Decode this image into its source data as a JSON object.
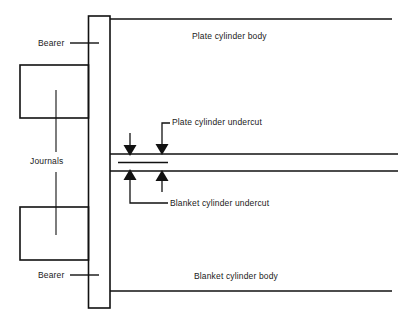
{
  "diagram": {
    "stroke_color": "#111111",
    "background_color": "#ffffff",
    "labels": {
      "bearer_top": "Bearer",
      "bearer_bottom": "Bearer",
      "journals": "Journals",
      "plate_cylinder_body": "Plate cylinder body",
      "blanket_cylinder_body": "Blanket cylinder body",
      "plate_cylinder_undercut": "Plate cylinder undercut",
      "blanket_cylinder_undercut": "Blanket cylinder undercut"
    }
  }
}
